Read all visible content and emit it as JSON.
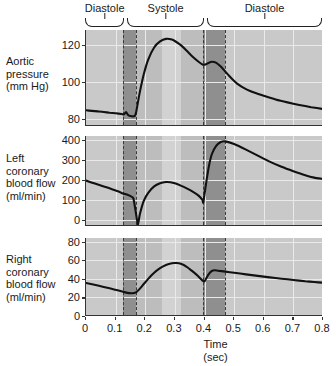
{
  "figure": {
    "title": "",
    "x_axis": {
      "label_line1": "Time",
      "label_line2": "(sec)",
      "ticks": [
        "0",
        "0.1",
        "0.2",
        "0.3",
        "0.4",
        "0.5",
        "0.6",
        "0.7",
        "0.8"
      ],
      "min": 0,
      "max": 0.8
    },
    "phase_brackets": [
      {
        "label": "Diastole",
        "start": 0.0,
        "end": 0.133
      },
      {
        "label": "Systole",
        "start": 0.142,
        "end": 0.402
      },
      {
        "label": "Diastole",
        "start": 0.412,
        "end": 0.8
      }
    ],
    "shaded_bands": [
      {
        "name": "isovolumetric-contraction",
        "tone": "dark",
        "start": 0.125,
        "end": 0.17,
        "dashed_edges": true
      },
      {
        "name": "ejection-early",
        "tone": "mid",
        "start": 0.17,
        "end": 0.255,
        "dashed_edges": false
      },
      {
        "name": "ejection-mid",
        "tone": "light",
        "start": 0.255,
        "end": 0.32,
        "dashed_edges": false
      },
      {
        "name": "ejection-late",
        "tone": "mid",
        "start": 0.32,
        "end": 0.395,
        "dashed_edges": false
      },
      {
        "name": "isovolumetric-relaxation",
        "tone": "dark",
        "start": 0.395,
        "end": 0.47,
        "dashed_edges": true
      }
    ]
  },
  "chart_data": [
    {
      "type": "line",
      "name": "aortic-pressure",
      "title": "",
      "ylabel_lines": [
        "Aortic",
        "pressure",
        "(mm Hg)"
      ],
      "xlabel": "Time (sec)",
      "ylim": [
        76,
        128
      ],
      "xlim": [
        0,
        0.8
      ],
      "yticks": [
        80,
        100,
        120
      ],
      "grid": true,
      "units": "mm Hg",
      "x": [
        0.0,
        0.02,
        0.04,
        0.06,
        0.08,
        0.1,
        0.12,
        0.128,
        0.135,
        0.142,
        0.15,
        0.158,
        0.165,
        0.17,
        0.18,
        0.195,
        0.21,
        0.23,
        0.25,
        0.27,
        0.29,
        0.305,
        0.32,
        0.34,
        0.36,
        0.38,
        0.395,
        0.405,
        0.415,
        0.425,
        0.44,
        0.455,
        0.47,
        0.49,
        0.51,
        0.54,
        0.57,
        0.6,
        0.64,
        0.68,
        0.72,
        0.76,
        0.8
      ],
      "y": [
        84.5,
        84.2,
        83.9,
        83.6,
        83.2,
        82.9,
        82.5,
        82.3,
        83.5,
        82.0,
        81.4,
        81.2,
        81.5,
        84.0,
        93.0,
        104.0,
        112.0,
        118.5,
        121.8,
        123.2,
        122.8,
        121.5,
        119.8,
        116.8,
        113.5,
        110.8,
        109.2,
        109.4,
        110.3,
        110.8,
        110.2,
        108.2,
        105.5,
        102.0,
        99.0,
        96.0,
        94.0,
        92.4,
        90.4,
        88.8,
        87.4,
        86.2,
        85.2
      ]
    },
    {
      "type": "line",
      "name": "left-coronary-blood-flow",
      "title": "",
      "ylabel_lines": [
        "Left",
        "coronary",
        "blood flow",
        "(ml/min)"
      ],
      "xlabel": "Time (sec)",
      "ylim": [
        -30,
        420
      ],
      "xlim": [
        0,
        0.8
      ],
      "yticks": [
        0,
        100,
        200,
        300,
        400
      ],
      "grid": true,
      "units": "ml/min",
      "x": [
        0.0,
        0.03,
        0.06,
        0.09,
        0.11,
        0.125,
        0.14,
        0.152,
        0.16,
        0.168,
        0.175,
        0.182,
        0.195,
        0.21,
        0.23,
        0.25,
        0.27,
        0.285,
        0.3,
        0.32,
        0.34,
        0.36,
        0.38,
        0.393,
        0.396,
        0.405,
        0.415,
        0.425,
        0.44,
        0.455,
        0.47,
        0.5,
        0.54,
        0.58,
        0.62,
        0.66,
        0.7,
        0.74,
        0.77,
        0.8
      ],
      "y": [
        197,
        182,
        168,
        153,
        142,
        133,
        126,
        118,
        108,
        40,
        -22,
        30,
        96,
        136,
        168,
        184,
        190,
        189,
        184,
        172,
        158,
        142,
        122,
        100,
        88,
        180,
        270,
        330,
        372,
        390,
        393,
        380,
        352,
        322,
        292,
        266,
        244,
        224,
        212,
        205
      ]
    },
    {
      "type": "line",
      "name": "right-coronary-blood-flow",
      "title": "",
      "ylabel_lines": [
        "Right",
        "coronary",
        "blood flow",
        "(ml/min)"
      ],
      "xlabel": "Time (sec)",
      "ylim": [
        0,
        84
      ],
      "xlim": [
        0,
        0.8
      ],
      "yticks": [
        0,
        20,
        40,
        60,
        80
      ],
      "grid": true,
      "units": "ml/min",
      "x": [
        0.0,
        0.04,
        0.08,
        0.11,
        0.135,
        0.155,
        0.17,
        0.182,
        0.195,
        0.21,
        0.23,
        0.25,
        0.27,
        0.29,
        0.305,
        0.32,
        0.34,
        0.36,
        0.378,
        0.392,
        0.4,
        0.412,
        0.425,
        0.435,
        0.445,
        0.47,
        0.5,
        0.54,
        0.58,
        0.62,
        0.66,
        0.7,
        0.74,
        0.77,
        0.8
      ],
      "y": [
        35.5,
        32.8,
        29.8,
        27.4,
        25.2,
        24.5,
        25.8,
        29.5,
        34.5,
        40.0,
        46.5,
        51.5,
        55.0,
        56.8,
        57.0,
        56.2,
        53.0,
        48.0,
        43.0,
        38.5,
        37.2,
        44.0,
        48.5,
        49.2,
        48.8,
        47.8,
        46.6,
        44.8,
        43.2,
        41.6,
        40.2,
        38.8,
        37.4,
        36.6,
        35.8
      ]
    }
  ]
}
